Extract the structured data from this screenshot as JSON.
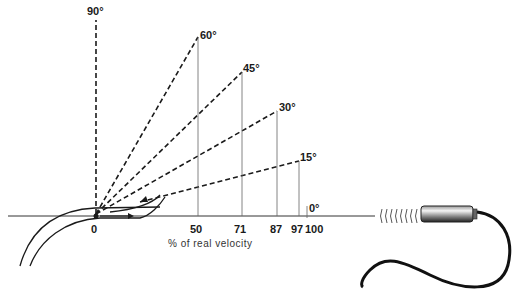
{
  "diagram": {
    "angle_labels": [
      "90°",
      "60°",
      "45°",
      "30°",
      "15°",
      "0°"
    ],
    "tick_labels": {
      "origin": "0",
      "t50": "50",
      "t71": "71",
      "t87": "87",
      "t97": "97",
      "t100": "100"
    },
    "axis_label": "% of real velocity",
    "angles": [
      {
        "angle": "90°",
        "percent": 0
      },
      {
        "angle": "60°",
        "percent": 50
      },
      {
        "angle": "45°",
        "percent": 71
      },
      {
        "angle": "30°",
        "percent": 87
      },
      {
        "angle": "15°",
        "percent": 97
      },
      {
        "angle": "0°",
        "percent": 100
      }
    ],
    "colors": {
      "ink": "#1a1a1a",
      "thin_line": "#555555"
    }
  }
}
